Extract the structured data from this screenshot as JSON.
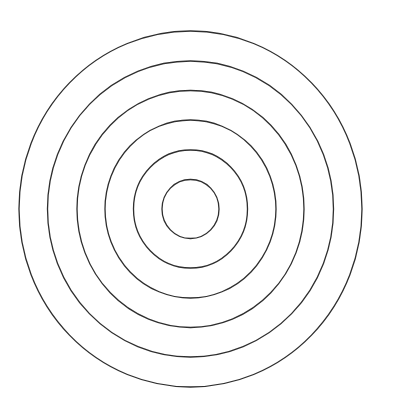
{
  "diagram": {
    "type": "concentric-circles",
    "background": "#ffffff",
    "stroke_color": "#2e2e2e",
    "stroke_width": 1.3,
    "center": {
      "cx": 190.5,
      "cy": 209
    },
    "rings": [
      {
        "rx": 28.5,
        "ry": 29.5
      },
      {
        "rx": 57,
        "ry": 59
      },
      {
        "rx": 85.5,
        "ry": 89
      },
      {
        "rx": 113.5,
        "ry": 118.5
      },
      {
        "rx": 143,
        "ry": 148
      },
      {
        "rx": 171.5,
        "ry": 178
      }
    ]
  }
}
